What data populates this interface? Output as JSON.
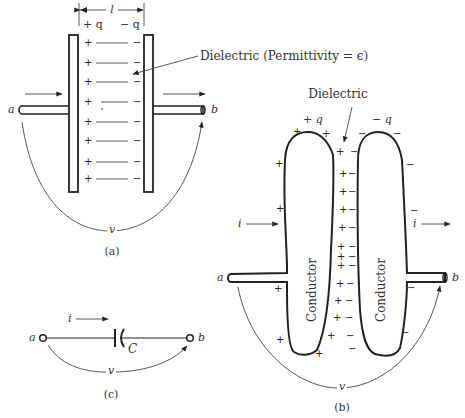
{
  "figure": {
    "panel_a": {
      "caption": "(a)",
      "length_label": "l",
      "plus_charge_label": "+ q",
      "minus_charge_label": "− q",
      "dielectric_label": "Dielectric (Permittivity = ϵ)",
      "terminal_a": "a",
      "terminal_b": "b",
      "voltage_label": "v",
      "plus_sign": "+",
      "minus_sign": "−",
      "charge_rows": 8
    },
    "panel_b": {
      "caption": "(b)",
      "dielectric_label": "Dielectric",
      "plus_charge_label": "+ q",
      "minus_charge_label": "− q",
      "left_conductor_label": "Conductor",
      "right_conductor_label": "Conductor",
      "current_in_label": "i",
      "current_out_label": "i",
      "terminal_a": "a",
      "terminal_b": "b",
      "voltage_label": "v"
    },
    "panel_c": {
      "caption": "(c)",
      "current_label": "i",
      "capacitor_label": "C",
      "terminal_a": "a",
      "terminal_b": "b",
      "voltage_label": "v"
    }
  }
}
